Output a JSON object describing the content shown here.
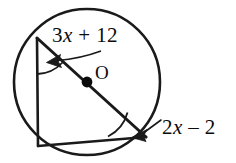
{
  "figure": {
    "kind": "circle-geometry-diagram",
    "background_color": "#ffffff",
    "stroke_color": "#1a1a1a",
    "labels": {
      "center_point": "O",
      "angle_top_left": {
        "full": "3x + 12",
        "coefficient": "3",
        "variable": "x",
        "operator": "+",
        "constant": "12"
      },
      "angle_bottom_right": {
        "full": "2x – 2",
        "coefficient": "2",
        "variable": "x",
        "operator": "–",
        "constant": "2"
      }
    },
    "geometry": {
      "circle": {
        "cx": 87,
        "cy": 82,
        "r": 73
      },
      "center_dot": {
        "cx": 87,
        "cy": 82,
        "r": 5
      },
      "vertices": {
        "top_left": {
          "x": 37,
          "y": 38
        },
        "bottom_left": {
          "x": 38,
          "y": 146
        },
        "bottom_right": {
          "x": 146,
          "y": 137
        }
      },
      "segments": [
        {
          "name": "diameter",
          "x1": 37,
          "y1": 38,
          "x2": 146,
          "y2": 137
        },
        {
          "name": "left-leg",
          "x1": 37,
          "y1": 38,
          "x2": 38,
          "y2": 146
        },
        {
          "name": "bottom-leg",
          "x1": 38,
          "y1": 146,
          "x2": 146,
          "y2": 137
        }
      ],
      "angle_arcs": [
        {
          "name": "arc-top-left",
          "path": "M 37.5 72 A 34 34 0 0 0 61 62"
        },
        {
          "name": "arc-bottom-right",
          "path": "M 110 136.5 A 36 36 0 0 0 128.5 113"
        }
      ],
      "leaders": [
        {
          "name": "leader-top",
          "type": "curved",
          "path": "M 100 52 C 84 56 68 58 54 60",
          "arrow_tip": {
            "x": 50,
            "y": 60.5
          },
          "arrow_angle_deg": 196
        },
        {
          "name": "leader-bottom",
          "type": "straight",
          "path": "M 160 121 L 143 133",
          "arrow_tip": {
            "x": 136,
            "y": 135.5
          },
          "arrow_angle_deg": 204
        }
      ]
    }
  }
}
